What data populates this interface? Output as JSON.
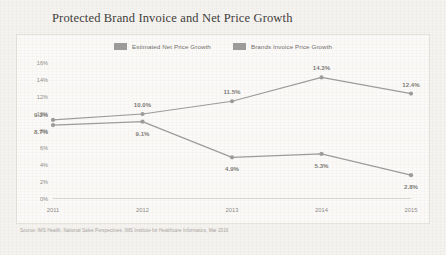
{
  "chart_data": {
    "type": "line",
    "title": "Protected Brand Invoice and Net Price Growth",
    "xlabel": "",
    "ylabel": "",
    "categories": [
      "2011",
      "2012",
      "2013",
      "2014",
      "2015"
    ],
    "ylim": [
      0,
      16
    ],
    "yticks": [
      "0%",
      "2%",
      "4%",
      "6%",
      "8%",
      "10%",
      "12%",
      "14%",
      "16%"
    ],
    "ytick_values": [
      0,
      2,
      4,
      6,
      8,
      10,
      12,
      14,
      16
    ],
    "grid": false,
    "legend_position": "top-center",
    "series": [
      {
        "name": "Brands Invoice Price Growth",
        "color": "#9b9b9b",
        "values": [
          9.3,
          10.0,
          11.5,
          14.3,
          12.4
        ],
        "labels": [
          "9.3%",
          "10.0%",
          "11.5%",
          "14.3%",
          "12.4%"
        ],
        "label_positions": [
          "above-left",
          "above",
          "above",
          "above",
          "above"
        ]
      },
      {
        "name": "Estimated Net Price Growth",
        "color": "#9b9b9b",
        "values": [
          8.7,
          9.1,
          4.9,
          5.3,
          2.8
        ],
        "labels": [
          "8.7%",
          "9.1%",
          "4.9%",
          "5.3%",
          "2.8%"
        ],
        "label_positions": [
          "below-left",
          "below",
          "below",
          "below",
          "below"
        ]
      }
    ],
    "source": "Source: IMS Health, National Sales Perspectives, IMS Institute for Healthcare Informatics, Mar 2016"
  },
  "legend": {
    "items": [
      {
        "label": "Estimated Net Price Growth",
        "color": "#9b9b9b"
      },
      {
        "label": "Brands Invoice Price Growth",
        "color": "#9b9b9b"
      }
    ]
  },
  "colors": {
    "page_background": "#f4f2ef",
    "card_background": "#fbfaf8",
    "card_border": "#e6e2dc",
    "line": "#9b9b9b",
    "axis": "#dcd8d2",
    "title_text": "#3c3a38",
    "tick_text": "#8d8a86",
    "label_text": "#7d7a76",
    "source_text": "#a8a49f"
  }
}
